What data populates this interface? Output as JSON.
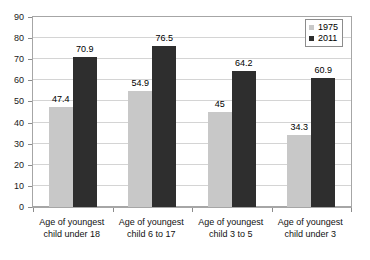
{
  "chart_data": {
    "type": "bar",
    "title": "",
    "subtitle": "",
    "xlabel": "",
    "ylabel": "",
    "ylim": [
      0,
      90
    ],
    "ytick_step": 10,
    "yticks": [
      "0",
      "10",
      "20",
      "30",
      "40",
      "50",
      "60",
      "70",
      "80",
      "90"
    ],
    "grid": true,
    "legend_position": "top-right",
    "categories": [
      "Age of youngest\nchild under 18",
      "Age of youngest\nchild 6 to 17",
      "Age of youngest\nchild 3 to 5",
      "Age of youngest\nchild under 3"
    ],
    "series": [
      {
        "name": "1975",
        "color": "#c8c8c8",
        "values": [
          47.4,
          54.9,
          45,
          34.3
        ],
        "labels": [
          "47.4",
          "54.9",
          "45",
          "34.3"
        ]
      },
      {
        "name": "2011",
        "color": "#2e2e2e",
        "values": [
          70.9,
          76.5,
          64.2,
          60.9
        ],
        "labels": [
          "70.9",
          "76.5",
          "64.2",
          "60.9"
        ]
      }
    ]
  },
  "legend": {
    "items": [
      {
        "label": "1975",
        "swatch": "legend-swatch-1975"
      },
      {
        "label": "2011",
        "swatch": "legend-swatch-2011"
      }
    ]
  },
  "colors": {
    "series_1975": "#c8c8c8",
    "series_2011": "#2e2e2e",
    "gridline": "#d4d4d4",
    "axis": "#a6a6a6",
    "background": "#ffffff",
    "text": "#111111"
  }
}
